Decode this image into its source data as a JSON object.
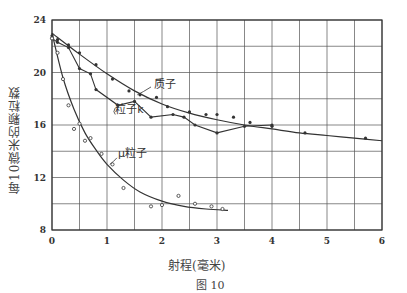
{
  "chart_data": {
    "type": "line",
    "title": "",
    "caption": "图 10",
    "xlabel": "射程(毫米)",
    "ylabel": "每10微米的颗粒数",
    "xlim": [
      0,
      6
    ],
    "ylim": [
      8,
      24
    ],
    "xticks": [
      0,
      1,
      2,
      3,
      4,
      5,
      6
    ],
    "yticks": [
      8,
      12,
      16,
      20,
      24
    ],
    "grid": true,
    "legend_position": "inline annotations",
    "series": [
      {
        "name": "质子",
        "marker": "filled-dot",
        "line": "smooth-fit",
        "points": [
          [
            0.0,
            22.8
          ],
          [
            0.1,
            22.5
          ],
          [
            0.3,
            22.1
          ],
          [
            0.5,
            21.5
          ],
          [
            0.8,
            20.6
          ],
          [
            1.1,
            19.5
          ],
          [
            1.4,
            18.6
          ],
          [
            1.6,
            18.3
          ],
          [
            1.9,
            18.1
          ],
          [
            2.1,
            17.4
          ],
          [
            2.5,
            17.0
          ],
          [
            2.8,
            16.8
          ],
          [
            3.0,
            16.8
          ],
          [
            3.3,
            16.6
          ],
          [
            3.6,
            16.2
          ],
          [
            4.0,
            15.9
          ],
          [
            4.6,
            15.4
          ],
          [
            5.7,
            15.0
          ]
        ],
        "fit": [
          [
            0.0,
            23.0
          ],
          [
            0.5,
            21.4
          ],
          [
            1.0,
            19.9
          ],
          [
            1.5,
            18.6
          ],
          [
            2.0,
            17.6
          ],
          [
            2.5,
            16.9
          ],
          [
            3.0,
            16.4
          ],
          [
            3.5,
            16.0
          ],
          [
            4.0,
            15.7
          ],
          [
            4.5,
            15.4
          ],
          [
            5.0,
            15.2
          ],
          [
            5.5,
            15.0
          ],
          [
            6.0,
            14.8
          ]
        ]
      },
      {
        "name": "粒子k",
        "marker": "filled-dot",
        "line": "segmented",
        "points": [
          [
            0.0,
            22.6
          ],
          [
            0.1,
            22.3
          ],
          [
            0.3,
            21.9
          ],
          [
            0.5,
            20.3
          ],
          [
            0.7,
            19.9
          ],
          [
            0.8,
            18.7
          ],
          [
            1.2,
            17.5
          ],
          [
            1.5,
            17.8
          ],
          [
            1.8,
            16.6
          ],
          [
            2.2,
            16.8
          ],
          [
            2.4,
            16.6
          ],
          [
            2.6,
            16.0
          ],
          [
            3.0,
            15.4
          ],
          [
            3.5,
            15.9
          ],
          [
            4.0,
            16.0
          ]
        ]
      },
      {
        "name": "μ粒子",
        "marker": "open-circle",
        "line": "smooth-fit",
        "points": [
          [
            0.0,
            22.6
          ],
          [
            0.1,
            21.5
          ],
          [
            0.2,
            19.5
          ],
          [
            0.3,
            17.5
          ],
          [
            0.4,
            15.7
          ],
          [
            0.5,
            16.1
          ],
          [
            0.6,
            14.8
          ],
          [
            0.7,
            15.0
          ],
          [
            0.9,
            13.8
          ],
          [
            1.1,
            13.0
          ],
          [
            1.3,
            11.2
          ],
          [
            1.8,
            9.8
          ],
          [
            2.0,
            9.9
          ],
          [
            2.3,
            10.6
          ],
          [
            2.6,
            10.0
          ],
          [
            2.9,
            9.8
          ],
          [
            3.1,
            9.6
          ]
        ],
        "fit": [
          [
            0.0,
            23.0
          ],
          [
            0.2,
            19.6
          ],
          [
            0.4,
            17.2
          ],
          [
            0.6,
            15.4
          ],
          [
            0.8,
            14.1
          ],
          [
            1.0,
            13.0
          ],
          [
            1.3,
            11.8
          ],
          [
            1.6,
            10.9
          ],
          [
            2.0,
            10.2
          ],
          [
            2.4,
            9.8
          ],
          [
            2.8,
            9.6
          ],
          [
            3.2,
            9.5
          ]
        ]
      }
    ],
    "annotations": [
      {
        "text": "质子",
        "x": 1.85,
        "y": 18.8
      },
      {
        "text": "粒子k",
        "x": 1.15,
        "y": 16.9
      },
      {
        "text": "μ粒子",
        "x": 1.2,
        "y": 13.6
      }
    ]
  },
  "figure": {
    "caption": "图 10",
    "xlabel": "射程(毫米)",
    "ylabel": "每10微米的颗粒数"
  },
  "colors": {
    "ink": "#333333",
    "grid": "#555555",
    "background": "#ffffff"
  }
}
